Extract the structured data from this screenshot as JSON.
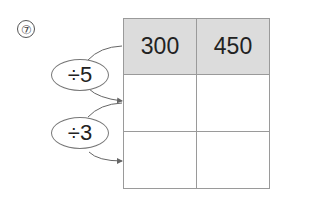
{
  "problem_number": "⑦",
  "table": {
    "header": [
      "300",
      "450"
    ],
    "rows": [
      [
        "",
        ""
      ],
      [
        "",
        ""
      ]
    ]
  },
  "operations": [
    {
      "label": "÷5"
    },
    {
      "label": "÷3"
    }
  ]
}
